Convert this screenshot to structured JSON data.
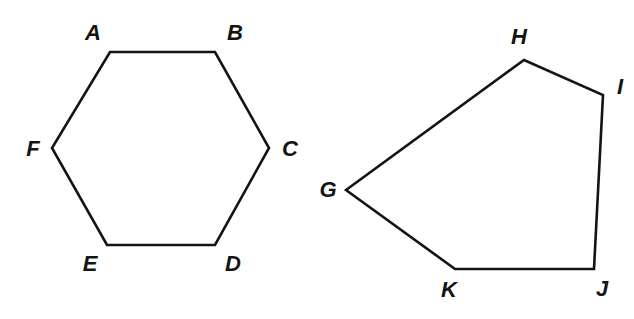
{
  "figure": {
    "background_color": "#ffffff",
    "stroke_color": "#141414",
    "stroke_width": 2.6,
    "label_color": "#141414",
    "width": 634,
    "height": 319,
    "shapes": [
      {
        "id": "hexagon-abcdef",
        "name": "hexagon",
        "sides": 6,
        "closed": true,
        "fill": "none",
        "vertices": [
          {
            "label": "A",
            "x": 110,
            "y": 52,
            "label_x": 93,
            "label_y": 33
          },
          {
            "label": "B",
            "x": 215,
            "y": 52,
            "label_x": 235,
            "label_y": 33
          },
          {
            "label": "C",
            "x": 269,
            "y": 148,
            "label_x": 290,
            "label_y": 149
          },
          {
            "label": "D",
            "x": 215,
            "y": 245,
            "label_x": 233,
            "label_y": 264
          },
          {
            "label": "E",
            "x": 107,
            "y": 245,
            "label_x": 90,
            "label_y": 264
          },
          {
            "label": "F",
            "x": 52,
            "y": 148,
            "label_x": 33,
            "label_y": 149
          }
        ],
        "edges": [
          "AB",
          "BC",
          "CD",
          "DE",
          "EF",
          "FA"
        ]
      },
      {
        "id": "pentagon-ghijk",
        "name": "pentagon",
        "sides": 5,
        "closed": true,
        "fill": "none",
        "vertices": [
          {
            "label": "G",
            "x": 346,
            "y": 190,
            "label_x": 328,
            "label_y": 190
          },
          {
            "label": "H",
            "x": 524,
            "y": 60,
            "label_x": 519,
            "label_y": 37
          },
          {
            "label": "I",
            "x": 603,
            "y": 95,
            "label_x": 620,
            "label_y": 87
          },
          {
            "label": "J",
            "x": 594,
            "y": 269,
            "label_x": 602,
            "label_y": 289
          },
          {
            "label": "K",
            "x": 455,
            "y": 269,
            "label_x": 449,
            "label_y": 290
          }
        ],
        "edges": [
          "GH",
          "HI",
          "IJ",
          "JK",
          "KG"
        ]
      }
    ]
  }
}
